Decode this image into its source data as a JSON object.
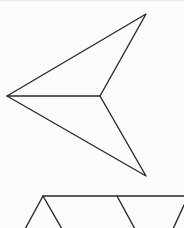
{
  "canvas": {
    "width": 184,
    "height": 228,
    "background": "#fbfbfb",
    "stroke_color": "#2b2b2b",
    "stroke_width": 1.4
  },
  "figures": {
    "arrowhead": {
      "label": "concave quadrilateral (arrowhead / dart)",
      "points": [
        [
          146,
          13
        ],
        [
          7,
          95
        ],
        [
          146,
          175
        ],
        [
          100,
          95
        ]
      ],
      "inner_segment": [
        [
          7,
          95
        ],
        [
          100,
          95
        ]
      ]
    },
    "zigzag": {
      "label": "partial triangle strip",
      "top_line": [
        [
          43,
          195
        ],
        [
          184,
          195
        ]
      ],
      "segments": [
        [
          [
            43,
            195
          ],
          [
            25,
            228
          ]
        ],
        [
          [
            43,
            195
          ],
          [
            62,
            228
          ]
        ],
        [
          [
            117,
            195
          ],
          [
            135,
            228
          ]
        ],
        [
          [
            184,
            204
          ],
          [
            173,
            228
          ]
        ]
      ]
    }
  }
}
